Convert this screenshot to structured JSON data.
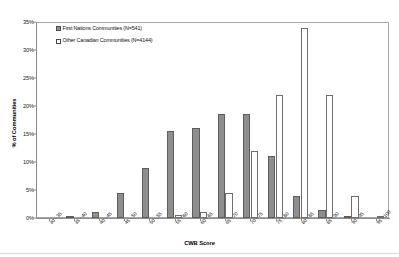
{
  "figure": {
    "clipped_title": "",
    "x_axis_title": "CWB Score",
    "y_axis_title": "% of Communities"
  },
  "legend": {
    "position": "top-left-inside",
    "entries": [
      {
        "label": "First Nations Communities (N=541)",
        "swatch": "filled-gray-square",
        "color": "#8e8e8e"
      },
      {
        "label": "Other Canadian Communities (N=4144)",
        "swatch": "open-white-square",
        "color": "#ffffff"
      }
    ]
  },
  "chart_data": {
    "type": "bar",
    "title": "",
    "xlabel": "CWB Score",
    "ylabel": "% of Communities",
    "ylim": [
      0,
      35
    ],
    "yticks": [
      0,
      5,
      10,
      15,
      20,
      25,
      30,
      35
    ],
    "ytick_labels": [
      "0%",
      "5%",
      "10%",
      "15%",
      "20%",
      "25%",
      "30%",
      "35%"
    ],
    "grid": false,
    "legend_position": "upper left",
    "categories": [
      "30 - 35",
      "35 - 40",
      "40 - 45",
      "45 - 50",
      "50 - 55",
      "55 - 60",
      "60 - 65",
      "65 - 70",
      "70 - 75",
      "75 - 80",
      "80 - 85",
      "85 - 90",
      "90 - 95",
      "95 - 100"
    ],
    "series": [
      {
        "name": "First Nations Communities (N=541)",
        "color": "#8e8e8e",
        "values": [
          0.0,
          0.3,
          1.0,
          4.5,
          9.0,
          15.5,
          16.0,
          18.5,
          18.5,
          11.0,
          4.0,
          1.5,
          0.3,
          0.0
        ]
      },
      {
        "name": "Other Canadian Communities (N=4144)",
        "color": "#ffffff",
        "values": [
          0.0,
          0.0,
          0.0,
          0.0,
          0.0,
          0.5,
          1.0,
          4.5,
          12.0,
          22.0,
          34.0,
          22.0,
          4.0,
          0.2
        ]
      }
    ]
  }
}
